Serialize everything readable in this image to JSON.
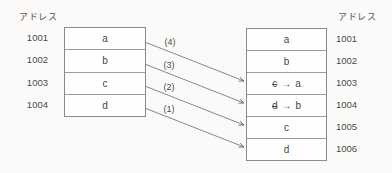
{
  "diagram": {
    "title_semantic": "memory block copy between address ranges",
    "left_column": {
      "header": "アドレス",
      "table": {
        "rows": [
          {
            "address": "1001",
            "value": "a"
          },
          {
            "address": "1002",
            "value": "b"
          },
          {
            "address": "1003",
            "value": "c"
          },
          {
            "address": "1004",
            "value": "d"
          }
        ]
      }
    },
    "right_column": {
      "header": "アドレス",
      "table": {
        "rows": [
          {
            "address": "1001",
            "value": "a"
          },
          {
            "address": "1002",
            "value": "b"
          },
          {
            "address": "1003",
            "old": "c",
            "arrow": "→",
            "new": "a"
          },
          {
            "address": "1004",
            "old": "d",
            "arrow": "→",
            "new": "b"
          },
          {
            "address": "1005",
            "value": "c"
          },
          {
            "address": "1006",
            "value": "d"
          }
        ]
      }
    },
    "arrows": [
      {
        "label": "(4)",
        "from_address": "1001",
        "from_value": "a",
        "to_address": "1003"
      },
      {
        "label": "(3)",
        "from_address": "1002",
        "from_value": "b",
        "to_address": "1004"
      },
      {
        "label": "(2)",
        "from_address": "1003",
        "from_value": "c",
        "to_address": "1005"
      },
      {
        "label": "(1)",
        "from_address": "1004",
        "from_value": "d",
        "to_address": "1006"
      }
    ],
    "colors": {
      "background": "#fbfaf8",
      "table_border": "#8a8a8a",
      "row_divider": "#9c9c9c",
      "text": "#4a4a4a",
      "arrow_line": "#6a6a6a"
    }
  }
}
